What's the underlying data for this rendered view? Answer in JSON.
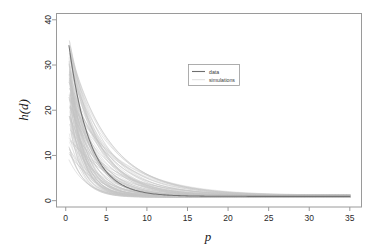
{
  "chart_data": {
    "type": "line",
    "title": "",
    "subtitle": "",
    "xlabel": "p",
    "ylabel": "h(d)",
    "xlim": [
      -1.2,
      36.5
    ],
    "ylim": [
      -1.4,
      41.5
    ],
    "xticks": [
      "0",
      "5",
      "10",
      "15",
      "20",
      "25",
      "30",
      "35"
    ],
    "xtick_values": [
      0,
      5,
      10,
      15,
      20,
      25,
      30,
      35
    ],
    "yticks": [
      "0",
      "10",
      "20",
      "30",
      "40"
    ],
    "ytick_values": [
      0,
      10,
      20,
      30,
      40
    ],
    "grid": false,
    "legend_position": "upper-center-right",
    "legend_entries": [
      {
        "label": "data",
        "color": "#6e6e6e",
        "width": 1.1
      },
      {
        "label": "simulations",
        "color": "#c4c4c4",
        "width": 0.55
      }
    ],
    "series": [
      {
        "name": "data",
        "role": "observed",
        "color": "#6e6e6e",
        "model": "exponential-decay-plus-offset",
        "formula": "h(d) = a * exp(-p / b) + c",
        "params": {
          "a": 39.0,
          "b": 2.55,
          "c": 0.95
        },
        "x": [
          0.4,
          1,
          2,
          3,
          4,
          5,
          6,
          7,
          8,
          10,
          12,
          15,
          20,
          25,
          30,
          35
        ],
        "values": [
          34.3,
          27.1,
          18.8,
          13.1,
          9.2,
          6.6,
          4.8,
          3.6,
          2.8,
          1.8,
          1.3,
          1.05,
          0.96,
          0.95,
          0.95,
          0.95
        ]
      },
      {
        "name": "simulations",
        "role": "simulated-ensemble",
        "color": "#c4c4c4",
        "count": 100,
        "model": "exponential-decay-plus-offset",
        "formula": "h(d) = a * exp(-p / b) + c",
        "amplitude_range": [
          8.0,
          39.5
        ],
        "decay_scale_range": [
          1.1,
          7.2
        ],
        "offset_range": [
          0.7,
          1.3
        ],
        "start_p": 0.4,
        "end_p": 35.0,
        "envelope_note": "all curves start between 8 and 40 at p~0.4 and converge toward ~1 by p~30"
      }
    ]
  },
  "plot_geometry": {
    "box_left": 56,
    "box_right": 362,
    "box_top": 13,
    "box_bottom": 207,
    "legend_box": {
      "x": 188,
      "y": 64,
      "width": 51,
      "height": 21
    }
  },
  "colors": {
    "frame": "#9a9a9a",
    "data_curve": "#6e6e6e",
    "simulation_curve": "#c4c4c4",
    "tick_text": "#2b2b2b",
    "background": "#ffffff"
  }
}
